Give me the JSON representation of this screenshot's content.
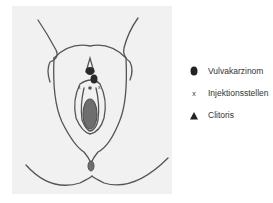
{
  "figure": {
    "colors": {
      "background": "#f1f1f1",
      "outline": "#555555",
      "tumor": "#2a2a2a",
      "fill": "#6e6e6e"
    }
  },
  "legend": {
    "items": [
      {
        "symbol": "tumor-icon",
        "label": "Vulvakarzinom"
      },
      {
        "symbol": "x-mark-icon",
        "label": "Injektionsstellen"
      },
      {
        "symbol": "triangle-icon",
        "label": "Clitoris"
      }
    ]
  }
}
